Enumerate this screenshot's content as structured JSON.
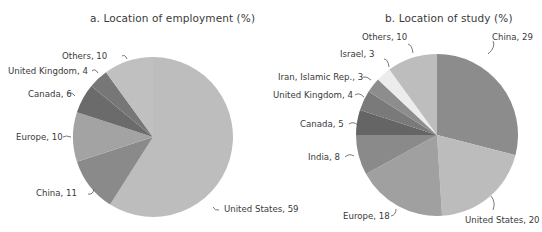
{
  "chart_data": [
    {
      "type": "pie",
      "title": "a. Location of employment (%)",
      "start_angle_deg": 0,
      "direction": "clockwise",
      "slices": [
        {
          "label": "United States",
          "value": 59,
          "color": "#bdbdbd"
        },
        {
          "label": "China",
          "value": 11,
          "color": "#8a8a8a"
        },
        {
          "label": "Europe",
          "value": 10,
          "color": "#a3a3a3"
        },
        {
          "label": "Canada",
          "value": 6,
          "color": "#6b6b6b"
        },
        {
          "label": "United Kingdom",
          "value": 4,
          "color": "#777777"
        },
        {
          "label": "Others",
          "value": 10,
          "color": "#c0c0c0"
        }
      ]
    },
    {
      "type": "pie",
      "title": "b. Location of study (%)",
      "start_angle_deg": 0,
      "direction": "clockwise",
      "slices": [
        {
          "label": "China",
          "value": 29,
          "color": "#8c8c8c"
        },
        {
          "label": "United States",
          "value": 20,
          "color": "#bcbcbc"
        },
        {
          "label": "Europe",
          "value": 18,
          "color": "#a0a0a0"
        },
        {
          "label": "India",
          "value": 8,
          "color": "#8a8a8a"
        },
        {
          "label": "Canada",
          "value": 5,
          "color": "#656565"
        },
        {
          "label": "United Kingdom",
          "value": 4,
          "color": "#7a7a7a"
        },
        {
          "label": "Iran, Islamic Rep.",
          "value": 3,
          "color": "#8d8d8d"
        },
        {
          "label": "Israel",
          "value": 3,
          "color": "#ececec"
        },
        {
          "label": "Others",
          "value": 10,
          "color": "#bdbdbd"
        }
      ]
    }
  ],
  "labels_a": {
    "us": "United States, 59",
    "china": "China, 11",
    "europe": "Europe, 10",
    "canada": "Canada, 6",
    "uk": "United Kingdom, 4",
    "others": "Others, 10"
  },
  "labels_b": {
    "china": "China, 29",
    "us": "United States, 20",
    "europe": "Europe, 18",
    "india": "India, 8",
    "canada": "Canada, 5",
    "uk": "United Kingdom, 4",
    "iran": "Iran, Islamic Rep., 3",
    "israel": "Israel, 3",
    "others": "Others, 10"
  }
}
